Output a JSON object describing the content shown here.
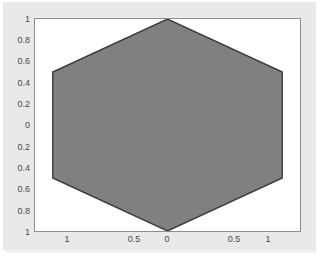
{
  "window": {
    "type": "matlab-figure",
    "background_color": "#e9e9e9",
    "plot_background_color": "#ffffff"
  },
  "chart_data": {
    "type": "area",
    "title": "",
    "xlabel": "",
    "ylabel": "",
    "xlim": [
      -1,
      1
    ],
    "ylim": [
      -1,
      1
    ],
    "grid": false,
    "legend": null,
    "x_tick_values": [
      -1,
      -0.5,
      0,
      0.5,
      1
    ],
    "x_tick_labels": [
      "1",
      "0.5",
      "0",
      "0.5",
      "1"
    ],
    "y_tick_values": [
      1,
      0.8,
      0.6,
      0.4,
      0.2,
      0,
      -0.2,
      -0.4,
      -0.6,
      -0.8,
      -1
    ],
    "y_tick_labels": [
      "1",
      "0.8",
      "0.6",
      "0.4",
      "0.2",
      "0",
      "0.2",
      "0.4",
      "0.6",
      "0.8",
      "1"
    ],
    "series": [
      {
        "name": "hexagon",
        "shape": "regular-hexagon",
        "fill_color": "#808080",
        "edge_color": "#3c3c3c",
        "closed": true,
        "x": [
          0,
          -0.866,
          -0.866,
          0,
          0.866,
          0.866
        ],
        "y": [
          1,
          0.5,
          -0.5,
          -1,
          -0.5,
          0.5
        ]
      }
    ]
  }
}
